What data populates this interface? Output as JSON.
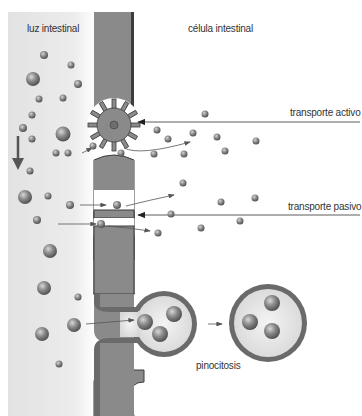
{
  "labels": {
    "lumen": "luz intestinal",
    "cell": "célula intestinal",
    "active": "transporte activo",
    "passive": "transporte pasivo",
    "pinocytosis": "pinocitosis"
  },
  "colors": {
    "membrane": "#8a8a8a",
    "membrane_edge": "#3c3c3c",
    "lumen_bg": "#e6e6e6",
    "particle": "#7a7a7a",
    "arrow": "#555555"
  },
  "regions": [
    {
      "name": "lumen",
      "label_ref": "labels.lumen"
    },
    {
      "name": "cell",
      "label_ref": "labels.cell"
    }
  ],
  "mechanisms": [
    {
      "name": "active-transport",
      "label_ref": "labels.active",
      "structure": "carrier-protein-pump"
    },
    {
      "name": "passive-transport",
      "label_ref": "labels.passive",
      "structure": "membrane-channel"
    },
    {
      "name": "pinocytosis",
      "label_ref": "labels.pinocytosis",
      "structure": "vesicle"
    }
  ]
}
